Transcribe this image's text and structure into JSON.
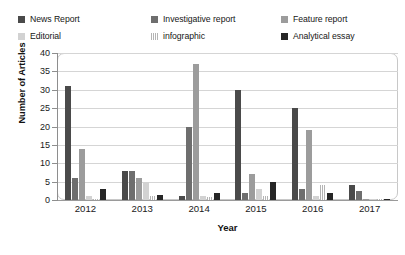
{
  "chart_data": {
    "type": "bar",
    "title": "",
    "xlabel": "Year",
    "ylabel": "Number of Articles",
    "categories": [
      "2012",
      "2013",
      "2014",
      "2015",
      "2016",
      "2017"
    ],
    "ylim": [
      0,
      40
    ],
    "ytick_step": 5,
    "yticks": [
      "40",
      "35",
      "30",
      "25",
      "20",
      "15",
      "10",
      "5",
      "0"
    ],
    "grid": true,
    "legend_position": "top",
    "series": [
      {
        "name": "News Report",
        "color": "#4a4a4a",
        "pattern": "solid",
        "values": [
          31,
          8,
          1,
          30,
          25,
          4
        ]
      },
      {
        "name": "Investigative report",
        "color": "#6e6e6e",
        "pattern": "solid",
        "values": [
          6,
          8,
          20,
          2,
          3,
          2.5
        ]
      },
      {
        "name": "Feature report",
        "color": "#9c9c9c",
        "pattern": "solid",
        "values": [
          14,
          6,
          37,
          7,
          19,
          0.4
        ]
      },
      {
        "name": "Editorial",
        "color": "#d2d2d2",
        "pattern": "solid",
        "values": [
          1,
          5,
          1,
          3,
          1,
          0.3
        ]
      },
      {
        "name": "infographic",
        "color": "#b4b4b4",
        "pattern": "stripe",
        "values": [
          0.4,
          1,
          0.7,
          1,
          4,
          0.3
        ]
      },
      {
        "name": "Analytical essay",
        "color": "#262626",
        "pattern": "solid",
        "values": [
          3,
          1.5,
          2,
          5,
          2,
          0.3
        ]
      }
    ]
  },
  "legend": {
    "items": [
      {
        "label": "News Report"
      },
      {
        "label": "Investigative report"
      },
      {
        "label": "Feature report"
      },
      {
        "label": "Editorial"
      },
      {
        "label": "infographic"
      },
      {
        "label": "Analytical essay"
      }
    ]
  }
}
